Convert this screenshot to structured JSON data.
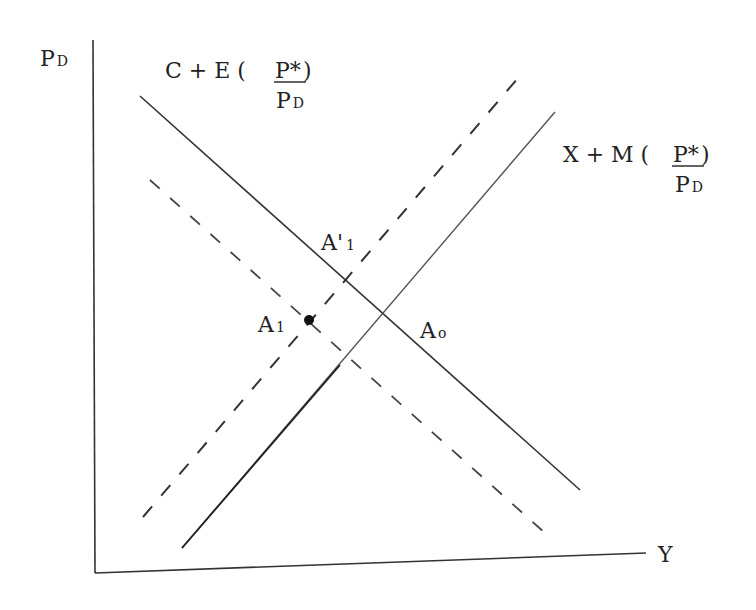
{
  "diagram": {
    "type": "economics-supply-demand-shift",
    "axes": {
      "y_label_main": "P",
      "y_label_sub": "D",
      "x_label": "Y"
    },
    "curves": [
      {
        "id": "demand-original",
        "label_prefix": "C + E (",
        "label_num": "P*",
        "label_close": ")",
        "label_den_main": "P",
        "label_den_sub": "D",
        "style": "solid"
      },
      {
        "id": "supply-original",
        "label_prefix": "X + M (",
        "label_num": "P*",
        "label_close": ")",
        "label_den_main": "P",
        "label_den_sub": "D",
        "style": "solid-light"
      },
      {
        "id": "demand-shifted",
        "style": "dashed"
      },
      {
        "id": "supply-shifted",
        "style": "dashed"
      }
    ],
    "points": [
      {
        "id": "A0",
        "label_main": "A",
        "label_sub": "o"
      },
      {
        "id": "A1",
        "label_main": "A",
        "label_sub": "1"
      },
      {
        "id": "A1prime",
        "label_main": "A'",
        "label_sub": "1"
      }
    ],
    "colors": {
      "ink": "#222222",
      "light_ink": "#555555",
      "background": "#ffffff"
    }
  }
}
